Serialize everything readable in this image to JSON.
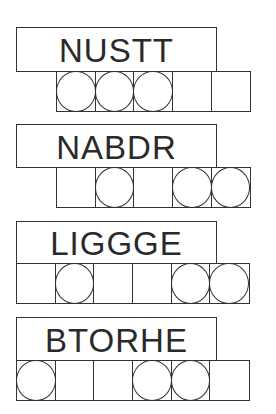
{
  "puzzles": [
    {
      "scrambled_word": "NUSTT",
      "label_top": 27,
      "label_height": 45,
      "row_left": 56,
      "row_top": 71,
      "cells": [
        {
          "circled": true
        },
        {
          "circled": true
        },
        {
          "circled": true
        },
        {
          "circled": false
        },
        {
          "circled": false
        }
      ]
    },
    {
      "scrambled_word": "NABDR",
      "label_top": 124,
      "label_height": 44,
      "row_left": 56,
      "row_top": 167,
      "cells": [
        {
          "circled": false
        },
        {
          "circled": true
        },
        {
          "circled": false
        },
        {
          "circled": true
        },
        {
          "circled": true
        }
      ]
    },
    {
      "scrambled_word": "LIGGGE",
      "label_top": 221,
      "label_height": 43,
      "row_left": 16,
      "row_top": 263,
      "cells": [
        {
          "circled": false
        },
        {
          "circled": true
        },
        {
          "circled": false
        },
        {
          "circled": false
        },
        {
          "circled": true
        },
        {
          "circled": true
        }
      ]
    },
    {
      "scrambled_word": "BTORHE",
      "label_top": 317,
      "label_height": 44,
      "row_left": 16,
      "row_top": 360,
      "cells": [
        {
          "circled": true
        },
        {
          "circled": false
        },
        {
          "circled": false
        },
        {
          "circled": true
        },
        {
          "circled": true
        },
        {
          "circled": false
        }
      ]
    }
  ],
  "colors": {
    "line": "#333333",
    "text": "#2a2a2a",
    "background": "#ffffff"
  }
}
